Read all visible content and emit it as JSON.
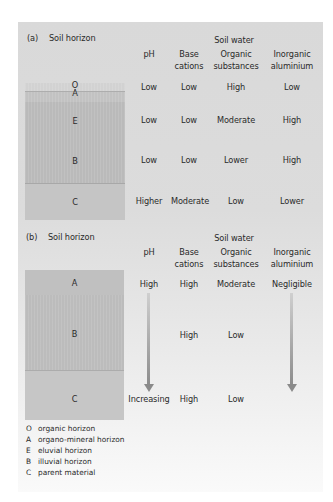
{
  "colors": {
    "panel_top": "#d9d9d9",
    "panel_bottom": "#fafafa",
    "layer_O": "#d0d0d0",
    "layer_A_a": "#bdbdbd",
    "layer_E": "#b9b9b9",
    "layer_B": "#b7b7b7",
    "layer_C": "#c4c4c4",
    "arrow": "#8a8a8a"
  },
  "columns": {
    "group_label": "Soil water",
    "ph": "pH",
    "base_1": "Base",
    "base_2": "cations",
    "organic_1": "Organic",
    "organic_2": "substances",
    "inorganic_1": "Inorganic",
    "inorganic_2": "aluminium"
  },
  "part_a": {
    "label": "(a)",
    "title": "Soil horizon",
    "layers": {
      "O": "O",
      "A": "A",
      "E": "E",
      "B": "B",
      "C": "C"
    },
    "rows": [
      {
        "horizon": "O/A",
        "ph": "Low",
        "base": "Low",
        "organic": "High",
        "aluminium": "Low"
      },
      {
        "horizon": "E",
        "ph": "Low",
        "base": "Low",
        "organic": "Moderate",
        "aluminium": "High"
      },
      {
        "horizon": "B",
        "ph": "Low",
        "base": "Low",
        "organic": "Lower",
        "aluminium": "High"
      },
      {
        "horizon": "C",
        "ph": "Higher",
        "base": "Moderate",
        "organic": "Low",
        "aluminium": "Lower"
      }
    ]
  },
  "part_b": {
    "label": "(b)",
    "title": "Soil horizon",
    "layers": {
      "A": "A",
      "B": "B",
      "C": "C"
    },
    "rows": [
      {
        "horizon": "A",
        "ph": "High",
        "base": "High",
        "organic": "Moderate",
        "aluminium": "Negligible"
      },
      {
        "horizon": "B",
        "ph": "",
        "base": "High",
        "organic": "Low",
        "aluminium": ""
      },
      {
        "horizon": "C",
        "ph": "Increasing",
        "base": "High",
        "organic": "Low",
        "aluminium": ""
      }
    ],
    "arrows": [
      "ph-trend-arrow",
      "aluminium-trend-arrow"
    ]
  },
  "legend": [
    {
      "key": "O",
      "text": "organic horizon"
    },
    {
      "key": "A",
      "text": "organo-mineral horizon"
    },
    {
      "key": "E",
      "text": "eluvial horizon"
    },
    {
      "key": "B",
      "text": "illuvial horizon"
    },
    {
      "key": "C",
      "text": "parent material"
    }
  ]
}
